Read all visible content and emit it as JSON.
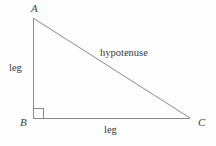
{
  "figure": {
    "kind": "right-triangle-diagram",
    "background_color": "#fdfdfd",
    "stroke_color": "#8a8a8a",
    "text_color": "#3f3f3f",
    "stroke_width": 1,
    "width": 216,
    "height": 146
  },
  "vertices": {
    "a": {
      "label": "A",
      "x": 33,
      "y": 18
    },
    "b": {
      "label": "B",
      "x": 33,
      "y": 118
    },
    "c": {
      "label": "C",
      "x": 190,
      "y": 118
    }
  },
  "sides": {
    "vertical_leg": {
      "label": "leg",
      "from": "A",
      "to": "B"
    },
    "horizontal_leg": {
      "label": "leg",
      "from": "B",
      "to": "C"
    },
    "hypotenuse": {
      "label": "hypotenuse",
      "from": "A",
      "to": "C"
    }
  },
  "right_angle_marker": {
    "at_vertex": "B",
    "size": 10,
    "x": 33,
    "y": 108
  }
}
